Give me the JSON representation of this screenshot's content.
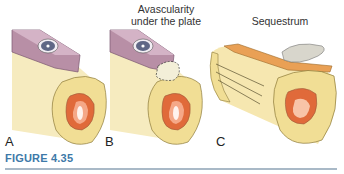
{
  "figure": {
    "caption_label": "FIGURE 4.35",
    "panels": [
      {
        "id": "A",
        "label": "A",
        "annotation": ""
      },
      {
        "id": "B",
        "label": "B",
        "annotation_line1": "Avascularity",
        "annotation_line2": "under the plate"
      },
      {
        "id": "C",
        "label": "C",
        "annotation": "Sequestrum"
      }
    ]
  },
  "colors": {
    "caption": "#3d79a8",
    "rule": "#a9b9c7",
    "bone": "#f3e2a6",
    "plate": "#b690a8",
    "marrow": "#d9452a"
  }
}
